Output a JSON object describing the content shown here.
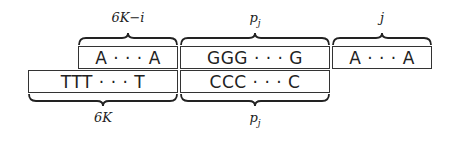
{
  "diagram": {
    "top_row": [
      {
        "content": "A · · · A",
        "label": "6K−i"
      },
      {
        "content": "GGG · · · G",
        "label": "p_j",
        "label_display": "pj"
      },
      {
        "content": "A · · · A",
        "label": "j"
      }
    ],
    "bottom_row": [
      {
        "content": "TTT · · · T",
        "label": "6K"
      },
      {
        "content": "CCC · · · C",
        "label": "p_j",
        "label_display": "pj"
      }
    ]
  }
}
